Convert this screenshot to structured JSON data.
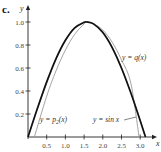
{
  "panel_label": "c.",
  "chart_data": {
    "type": "line",
    "title": "",
    "xlabel": "x",
    "ylabel": "y",
    "xlim": [
      0,
      3.25
    ],
    "ylim": [
      0,
      1.05
    ],
    "grid": false,
    "x_ticks": [
      "0.5",
      "1.0",
      "1.5",
      "2.0",
      "2.5",
      "3.0"
    ],
    "y_ticks": [
      "0.2",
      "0.4",
      "0.6",
      "0.8",
      "1.0"
    ],
    "series": [
      {
        "name": "y = sin x",
        "color": "#111111",
        "x": [
          0,
          0.25,
          0.5,
          0.75,
          1.0,
          1.25,
          1.5,
          1.5708,
          1.75,
          2.0,
          2.25,
          2.5,
          2.75,
          3.0,
          3.1416
        ],
        "values": [
          0,
          0.247,
          0.479,
          0.682,
          0.841,
          0.949,
          0.997,
          1.0,
          0.984,
          0.909,
          0.778,
          0.598,
          0.382,
          0.141,
          0
        ]
      },
      {
        "name": "y = p_2(x)",
        "color": "#999999",
        "x": [
          0.17,
          0.5,
          0.75,
          1.0,
          1.25,
          1.5,
          1.5708,
          1.75,
          2.0,
          2.25,
          2.5,
          2.75,
          2.97
        ],
        "values": [
          0,
          0.355,
          0.576,
          0.756,
          0.894,
          0.983,
          1.0,
          0.985,
          0.93,
          0.825,
          0.67,
          0.467,
          0
        ]
      },
      {
        "name": "y = q(x)",
        "color": "#aaaaaa",
        "x": [
          0,
          0.25,
          0.5,
          0.75,
          1.0,
          1.25,
          1.5,
          1.5708,
          1.75,
          2.0,
          2.25,
          2.5,
          2.75,
          3.0,
          3.1416
        ],
        "values": [
          0,
          0.24,
          0.47,
          0.675,
          0.84,
          0.952,
          0.998,
          1.0,
          0.987,
          0.915,
          0.785,
          0.605,
          0.39,
          0.15,
          0
        ]
      }
    ],
    "annotations": [
      {
        "text": "y = q(x)",
        "x": 2.75,
        "y": 0.68
      },
      {
        "text": "y = p₂(x)",
        "x": 0.55,
        "y": 0.16
      },
      {
        "text": "y = sin x",
        "x": 1.85,
        "y": 0.16
      }
    ],
    "legend_position": "inline-labels"
  }
}
